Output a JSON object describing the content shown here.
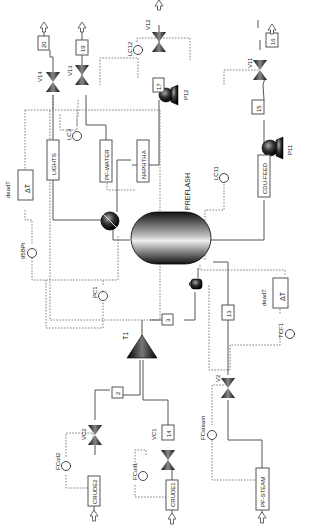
{
  "diagram": {
    "type": "process-flow-diagram",
    "orientation": "rotated-90-ccw",
    "colors": {
      "pipe": "#555555",
      "signal": "#666666",
      "equipment_dark": "#1a1a1a",
      "background": "#ffffff"
    }
  },
  "equipment": {
    "preflash": "PREFLASH",
    "mixer": "T1",
    "pump_p11": "P11",
    "pump_p12": "P12",
    "delta_t_top": "deadT",
    "delta_t_bottom": "deadT",
    "delta_t_symbol": "ΔT"
  },
  "streams": {
    "lights": "LIGHTS",
    "pf_water": "PF-WATER",
    "naphtha": "NAPHTHA",
    "cdu_feed": "CDU-FEED",
    "crude1": "CRUDE1",
    "crude2": "CRUDE2",
    "pf_steam": "PF-STEAM",
    "s2": "2",
    "s3": "3",
    "s13": "13",
    "s14": "14",
    "s15": "15",
    "s16": "16",
    "s17": "17",
    "s19": "19",
    "s20": "20"
  },
  "valves": {
    "v11": "V11",
    "v12": "V12",
    "v13": "V13",
    "v14": "V14",
    "v2": "V2",
    "vc1": "VC1",
    "vc2": "VC2"
  },
  "controllers": {
    "lc3": "LC3",
    "lc11": "LC11",
    "lc12": "LC12",
    "pc1": "PC1",
    "tcf1": "TCF1",
    "tbp95": "95BPt",
    "fcoil1": "FCoil1",
    "fcoil2": "FCoil2",
    "fcsteam": "FCsteam"
  }
}
